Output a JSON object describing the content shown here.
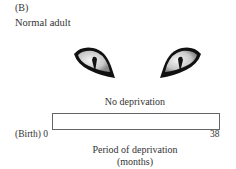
{
  "figure": {
    "panel_label": "(B)",
    "subtitle": "Normal adult",
    "eyes": [
      {
        "side": "left",
        "icon": "cat-eye-icon"
      },
      {
        "side": "right",
        "icon": "cat-eye-icon"
      }
    ],
    "bar": {
      "label": "No deprivation",
      "start_label": "(Birth) 0",
      "end_label": "38"
    },
    "axis": {
      "title": "Period of deprivation",
      "units": "(months)"
    }
  }
}
